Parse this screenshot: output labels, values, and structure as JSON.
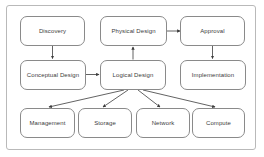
{
  "diagram": {
    "frame": {
      "border_color": "#b9b9b9",
      "background": "#ffffff"
    },
    "node_style": {
      "border_color": "#8a8a8a",
      "fill": "#ffffff",
      "text_color": "#3b3b3b"
    },
    "edge_style": {
      "color": "#3b3b3b"
    },
    "nodes": [
      {
        "id": "discovery",
        "label": "Discovery",
        "row": "top",
        "column": 1
      },
      {
        "id": "physical-design",
        "label": "Physical Design",
        "row": "top",
        "column": 2
      },
      {
        "id": "approval",
        "label": "Approval",
        "row": "top",
        "column": 3
      },
      {
        "id": "conceptual-design",
        "label": "Conceptual Design",
        "row": "middle",
        "column": 1
      },
      {
        "id": "logical-design",
        "label": "Logical Design",
        "row": "middle",
        "column": 2
      },
      {
        "id": "implementation",
        "label": "Implementation",
        "row": "middle",
        "column": 3
      },
      {
        "id": "management",
        "label": "Management",
        "row": "bottom",
        "column": 1
      },
      {
        "id": "storage",
        "label": "Storage",
        "row": "bottom",
        "column": 2
      },
      {
        "id": "network",
        "label": "Network",
        "row": "bottom",
        "column": 3
      },
      {
        "id": "compute",
        "label": "Compute",
        "row": "bottom",
        "column": 4
      }
    ],
    "edges": [
      {
        "from": "discovery",
        "to": "conceptual-design",
        "direction": "down"
      },
      {
        "from": "conceptual-design",
        "to": "logical-design",
        "direction": "right"
      },
      {
        "from": "logical-design",
        "to": "physical-design",
        "direction": "up"
      },
      {
        "from": "physical-design",
        "to": "approval",
        "direction": "right"
      },
      {
        "from": "approval",
        "to": "implementation",
        "direction": "down"
      },
      {
        "from": "logical-design",
        "to": "management",
        "direction": "diagonal-down-left"
      },
      {
        "from": "logical-design",
        "to": "storage",
        "direction": "diagonal-down-left"
      },
      {
        "from": "logical-design",
        "to": "network",
        "direction": "diagonal-down-right"
      },
      {
        "from": "logical-design",
        "to": "compute",
        "direction": "diagonal-down-right"
      }
    ]
  }
}
